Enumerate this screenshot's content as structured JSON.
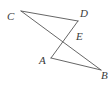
{
  "figure": {
    "kind": "geometry-diagram",
    "background_color": "#ffffff",
    "line_color": "#555555",
    "label_color": "#3a3a3a",
    "width": 112,
    "height": 88,
    "points": [
      {
        "id": "C",
        "label": "C",
        "x": 21,
        "y": 11,
        "label_x": 7,
        "label_y": 11
      },
      {
        "id": "D",
        "label": "D",
        "x": 78,
        "y": 21,
        "label_x": 80,
        "label_y": 8
      },
      {
        "id": "E",
        "label": "E",
        "x": 72,
        "y": 31,
        "label_x": 76,
        "label_y": 31
      },
      {
        "id": "A",
        "label": "A",
        "x": 51,
        "y": 58,
        "label_x": 39,
        "label_y": 55
      },
      {
        "id": "B",
        "label": "B",
        "x": 101,
        "y": 70,
        "label_x": 101,
        "label_y": 70
      }
    ],
    "segments": [
      {
        "id": "CD",
        "from": "C",
        "to": "D"
      },
      {
        "id": "CB",
        "from": "C",
        "to": "B"
      },
      {
        "id": "DA",
        "from": "D",
        "to": "A"
      },
      {
        "id": "AB",
        "from": "A",
        "to": "B"
      }
    ]
  }
}
